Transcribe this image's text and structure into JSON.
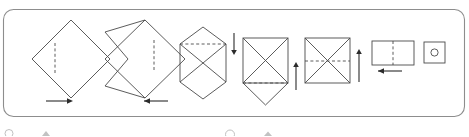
{
  "panel": {
    "name": "origami-instruction-panel",
    "border_color": "#8d8d8d",
    "corner_radius": 10,
    "background": "#ffffff",
    "x": 3,
    "y": 9,
    "width": 462,
    "height": 108
  },
  "style": {
    "shape_stroke": "#4a4a4a",
    "crease_stroke": "#4a4a4a",
    "arrow_color": "#2b2b2b",
    "crease_dash": "3 2.4",
    "stroke_width": 0.9
  },
  "steps": [
    {
      "index": 1,
      "name": "step-diamond-with-vertical-crease",
      "shape": "diamond",
      "description": "Square rotated 45 degrees with a vertical valley crease left of center",
      "center_x": 71,
      "center_y": 59,
      "half_width": 39,
      "half_height": 39,
      "crease": {
        "orientation": "vertical",
        "x": 55,
        "y1": 43,
        "y2": 75
      },
      "arrow": {
        "direction": "right",
        "x1": 46,
        "x2": 70,
        "y": 101
      }
    },
    {
      "index": 2,
      "name": "step-partial-fold-with-vertical-crease",
      "shape": "folded-diamond",
      "description": "Diamond with left flap folded inward forming a chevron, vertical crease right of center",
      "center_x": 145,
      "center_y": 59,
      "half_width": 40,
      "half_height": 39,
      "crease": {
        "orientation": "vertical",
        "x": 154,
        "y1": 40,
        "y2": 70
      },
      "arrow": {
        "direction": "left",
        "x1": 168,
        "x2": 144,
        "y": 101
      }
    },
    {
      "index": 3,
      "name": "step-hexagon-with-top-crease",
      "shape": "hexagon-x",
      "description": "Hexagonal folded form with X creases and a horizontal crease near the top",
      "center_x": 203,
      "center_y": 63,
      "half_width": 24,
      "crease": {
        "orientation": "horizontal",
        "y": 44,
        "x1": 180,
        "x2": 226
      },
      "arrow": {
        "direction": "down",
        "x": 224,
        "y1": 33,
        "y2": 53
      }
    },
    {
      "index": 4,
      "name": "step-square-with-bottom-flap",
      "shape": "square-x-bottom-triangle",
      "description": "Square with X creases plus a downward triangle flap and a horizontal crease at the square base",
      "left": 243,
      "top": 38,
      "size": 45,
      "crease": {
        "orientation": "horizontal",
        "y": 83,
        "x1": 243,
        "x2": 288
      },
      "arrow": {
        "direction": "up",
        "x": 288,
        "y1": 88,
        "y2": 64
      }
    },
    {
      "index": 5,
      "name": "step-square-with-middle-crease",
      "shape": "square-x",
      "description": "Square with X creases and a horizontal crease through the middle",
      "left": 305,
      "top": 38,
      "size": 45,
      "crease": {
        "orientation": "horizontal",
        "y": 61,
        "x1": 305,
        "x2": 350
      },
      "arrow": {
        "direction": "up",
        "x": 352,
        "y1": 80,
        "y2": 52
      }
    },
    {
      "index": 6,
      "name": "step-rectangle-with-vertical-crease",
      "shape": "rectangle",
      "description": "Horizontal rectangle with a vertical crease in the middle",
      "left": 360,
      "top": 41,
      "width": 42,
      "height": 24,
      "crease": {
        "orientation": "vertical",
        "x": 381,
        "y1": 41,
        "y2": 65
      },
      "arrow": {
        "direction": "left",
        "x1": 390,
        "x2": 366,
        "y": 70
      }
    },
    {
      "index": 7,
      "name": "step-final-square-with-circle",
      "shape": "square-with-circle",
      "description": "Completed small square with a circular marking in the center",
      "left": 416,
      "top": 42,
      "size": 21,
      "circle": {
        "cx": 426,
        "cy": 53,
        "r": 3.6
      }
    }
  ],
  "edge_icons": [
    {
      "name": "cut-off-icon-1",
      "x": 9,
      "y": 132,
      "glyph": "circle-outline"
    },
    {
      "name": "cut-off-icon-2",
      "x": 46,
      "y": 132,
      "glyph": "filled-marker"
    },
    {
      "name": "cut-off-icon-3",
      "x": 230,
      "y": 133,
      "glyph": "circle-outline"
    },
    {
      "name": "cut-off-icon-4",
      "x": 268,
      "y": 133,
      "glyph": "filled-marker"
    }
  ]
}
